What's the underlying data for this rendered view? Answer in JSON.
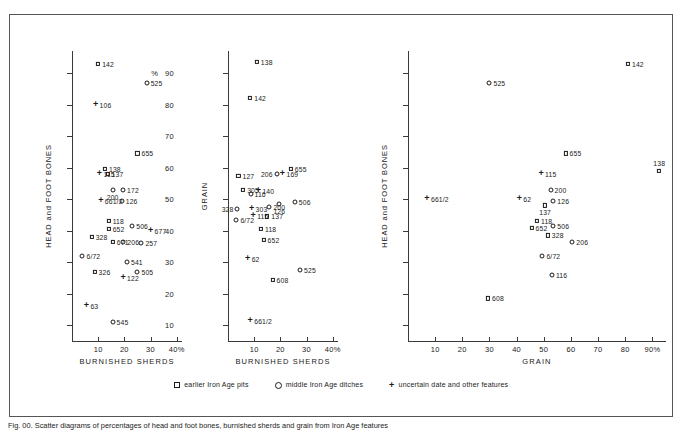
{
  "figure": {
    "caption": "Fig. 00. Scatter diagrams of percentages of head and foot bones, burnished sherds and grain from Iron Age features"
  },
  "legend": {
    "items": [
      {
        "marker": "square-marker",
        "label": "earlier Iron Age  pits"
      },
      {
        "marker": "circle-marker",
        "label": "middle Iron Age ditches"
      },
      {
        "marker": "plus-marker",
        "label": "uncertain date and other features"
      }
    ]
  },
  "chart_data": [
    {
      "type": "scatter",
      "title": "",
      "xlabel": "BURNISHED SHERDS",
      "ylabel": "HEAD and FOOT BONES",
      "x_unit": "%",
      "y_unit": "%",
      "xlim": [
        0,
        42
      ],
      "ylim": [
        5,
        97
      ],
      "xticks": [
        10,
        20,
        30,
        40
      ],
      "xticklabels": [
        "10",
        "20",
        "30",
        "40%"
      ],
      "yticks": [
        10,
        20,
        30,
        40,
        50,
        60,
        70,
        80,
        90
      ],
      "yticklabels": [
        "10",
        "20",
        "30",
        "40",
        "50",
        "60",
        "70",
        "80",
        "90"
      ],
      "grid": false,
      "points": [
        {
          "label": "142",
          "marker": "square",
          "x": 10.0,
          "y": 93.0,
          "lpos": "r"
        },
        {
          "label": "525",
          "marker": "circle",
          "x": 28.5,
          "y": 87.0,
          "lpos": "r"
        },
        {
          "label": "106",
          "marker": "plus",
          "x": 9.0,
          "y": 80.0,
          "lpos": "r"
        },
        {
          "label": "655",
          "marker": "square",
          "x": 25.0,
          "y": 64.5,
          "lpos": "r"
        },
        {
          "label": "138",
          "marker": "square",
          "x": 12.6,
          "y": 59.5,
          "lpos": "r"
        },
        {
          "label": "115",
          "marker": "plus",
          "x": 10.5,
          "y": 58.0,
          "lpos": "r"
        },
        {
          "label": "137",
          "marker": "square",
          "x": 13.6,
          "y": 58.0,
          "lpos": "r"
        },
        {
          "label": "172",
          "marker": "circle",
          "x": 19.5,
          "y": 53.0,
          "lpos": "r"
        },
        {
          "label": "200",
          "marker": "circle",
          "x": 15.5,
          "y": 53.0,
          "lpos": "b"
        },
        {
          "label": "661/2",
          "marker": "plus",
          "x": 11.0,
          "y": 49.5,
          "lpos": "r"
        },
        {
          "label": "126",
          "marker": "circle",
          "x": 19.0,
          "y": 49.5,
          "lpos": "r"
        },
        {
          "label": "118",
          "marker": "square",
          "x": 14.0,
          "y": 43.0,
          "lpos": "r"
        },
        {
          "label": "506",
          "marker": "circle",
          "x": 23.0,
          "y": 41.5,
          "lpos": "r"
        },
        {
          "label": "652",
          "marker": "square",
          "x": 14.0,
          "y": 40.5,
          "lpos": "r"
        },
        {
          "label": "677",
          "marker": "plus",
          "x": 30.0,
          "y": 40.0,
          "lpos": "r"
        },
        {
          "label": "328",
          "marker": "square",
          "x": 7.5,
          "y": 38.0,
          "lpos": "r"
        },
        {
          "label": "671",
          "marker": "square",
          "x": 15.6,
          "y": 36.5,
          "lpos": "r"
        },
        {
          "label": "206",
          "marker": "circle",
          "x": 19.6,
          "y": 36.5,
          "lpos": "r"
        },
        {
          "label": "257",
          "marker": "circle",
          "x": 26.5,
          "y": 36.0,
          "lpos": "r"
        },
        {
          "label": "6/72",
          "marker": "circle",
          "x": 4.0,
          "y": 32.0,
          "lpos": "r"
        },
        {
          "label": "541",
          "marker": "circle",
          "x": 21.0,
          "y": 30.0,
          "lpos": "r"
        },
        {
          "label": "326",
          "marker": "square",
          "x": 8.6,
          "y": 27.0,
          "lpos": "r"
        },
        {
          "label": "505",
          "marker": "circle",
          "x": 25.0,
          "y": 27.0,
          "lpos": "r"
        },
        {
          "label": "122",
          "marker": "plus",
          "x": 19.5,
          "y": 25.0,
          "lpos": "r"
        },
        {
          "label": "63",
          "marker": "plus",
          "x": 5.5,
          "y": 16.0,
          "lpos": "r"
        },
        {
          "label": "545",
          "marker": "circle",
          "x": 15.5,
          "y": 11.0,
          "lpos": "r"
        }
      ]
    },
    {
      "type": "scatter",
      "title": "",
      "xlabel": "BURNISHED SHERDS",
      "ylabel": "GRAIN",
      "x_unit": "%",
      "y_unit": "",
      "xlim": [
        0,
        42
      ],
      "ylim": [
        5,
        97
      ],
      "xticks": [
        10,
        20,
        30,
        40
      ],
      "xticklabels": [
        "10",
        "20",
        "30",
        "40%"
      ],
      "yticks": [
        10,
        20,
        30,
        40,
        50,
        60,
        70,
        80,
        90
      ],
      "yticklabels": [
        "",
        "",
        "",
        "",
        "",
        "",
        "",
        "",
        ""
      ],
      "grid": false,
      "points": [
        {
          "label": "138",
          "marker": "square",
          "x": 11.0,
          "y": 93.5,
          "lpos": "r"
        },
        {
          "label": "142",
          "marker": "square",
          "x": 8.5,
          "y": 82.0,
          "lpos": "r"
        },
        {
          "label": "655",
          "marker": "square",
          "x": 24.0,
          "y": 59.5,
          "lpos": "r"
        },
        {
          "label": "206",
          "marker": "circle",
          "x": 18.6,
          "y": 58.0,
          "lpos": "l"
        },
        {
          "label": "169",
          "marker": "plus",
          "x": 20.8,
          "y": 58.0,
          "lpos": "r"
        },
        {
          "label": "127",
          "marker": "square",
          "x": 4.0,
          "y": 57.5,
          "lpos": "r"
        },
        {
          "label": "305",
          "marker": "square",
          "x": 5.8,
          "y": 53.0,
          "lpos": "r"
        },
        {
          "label": "116",
          "marker": "circle",
          "x": 8.6,
          "y": 51.5,
          "lpos": "r"
        },
        {
          "label": "140",
          "marker": "plus",
          "x": 11.6,
          "y": 52.5,
          "lpos": "r"
        },
        {
          "label": "506",
          "marker": "circle",
          "x": 25.5,
          "y": 49.0,
          "lpos": "r"
        },
        {
          "label": "126",
          "marker": "circle",
          "x": 19.6,
          "y": 48.5,
          "lpos": "b"
        },
        {
          "label": "200",
          "marker": "circle",
          "x": 15.8,
          "y": 47.5,
          "lpos": "r"
        },
        {
          "label": "303",
          "marker": "plus",
          "x": 9.0,
          "y": 47.0,
          "lpos": "r"
        },
        {
          "label": "328",
          "marker": "circle",
          "x": 3.6,
          "y": 47.0,
          "lpos": "l"
        },
        {
          "label": "137",
          "marker": "square",
          "x": 15.0,
          "y": 44.5,
          "lpos": "r"
        },
        {
          "label": "115",
          "marker": "plus",
          "x": 9.6,
          "y": 44.5,
          "lpos": "r"
        },
        {
          "label": "6/72",
          "marker": "circle",
          "x": 3.2,
          "y": 43.5,
          "lpos": "r"
        },
        {
          "label": "118",
          "marker": "square",
          "x": 12.6,
          "y": 40.5,
          "lpos": "r"
        },
        {
          "label": "652",
          "marker": "square",
          "x": 13.6,
          "y": 37.0,
          "lpos": "r"
        },
        {
          "label": "62",
          "marker": "plus",
          "x": 7.5,
          "y": 31.0,
          "lpos": "r"
        },
        {
          "label": "525",
          "marker": "circle",
          "x": 27.5,
          "y": 27.5,
          "lpos": "r"
        },
        {
          "label": "608",
          "marker": "square",
          "x": 17.0,
          "y": 24.5,
          "lpos": "r"
        },
        {
          "label": "661/2",
          "marker": "plus",
          "x": 8.5,
          "y": 11.5,
          "lpos": "r"
        }
      ]
    },
    {
      "type": "scatter",
      "title": "",
      "xlabel": "GRAIN",
      "ylabel": "HEAD and FOOT BONES",
      "x_unit": "%",
      "y_unit": "%",
      "xlim": [
        0,
        95
      ],
      "ylim": [
        5,
        97
      ],
      "xticks": [
        10,
        20,
        30,
        40,
        50,
        60,
        70,
        80,
        90
      ],
      "xticklabels": [
        "10",
        "20",
        "30",
        "40",
        "50",
        "60",
        "70",
        "80",
        "90%"
      ],
      "yticks": [
        10,
        20,
        30,
        40,
        50,
        60,
        70,
        80,
        90
      ],
      "yticklabels": [
        "",
        "",
        "",
        "",
        "",
        "",
        "",
        "",
        ""
      ],
      "grid": false,
      "points": [
        {
          "label": "142",
          "marker": "square",
          "x": 81.0,
          "y": 93.0,
          "lpos": "r"
        },
        {
          "label": "525",
          "marker": "circle",
          "x": 30.0,
          "y": 87.0,
          "lpos": "r"
        },
        {
          "label": "655",
          "marker": "square",
          "x": 58.0,
          "y": 64.5,
          "lpos": "r"
        },
        {
          "label": "138",
          "marker": "square",
          "x": 92.5,
          "y": 59.0,
          "lpos": "t"
        },
        {
          "label": "115",
          "marker": "plus",
          "x": 49.0,
          "y": 58.0,
          "lpos": "r"
        },
        {
          "label": "200",
          "marker": "circle",
          "x": 52.5,
          "y": 53.0,
          "lpos": "r"
        },
        {
          "label": "126",
          "marker": "circle",
          "x": 53.5,
          "y": 49.5,
          "lpos": "r"
        },
        {
          "label": "62",
          "marker": "plus",
          "x": 41.0,
          "y": 50.0,
          "lpos": "r"
        },
        {
          "label": "137",
          "marker": "square",
          "x": 50.5,
          "y": 48.0,
          "lpos": "b"
        },
        {
          "label": "661/2",
          "marker": "plus",
          "x": 7.0,
          "y": 50.0,
          "lpos": "r"
        },
        {
          "label": "118",
          "marker": "square",
          "x": 47.5,
          "y": 43.0,
          "lpos": "r"
        },
        {
          "label": "506",
          "marker": "circle",
          "x": 53.5,
          "y": 41.5,
          "lpos": "r"
        },
        {
          "label": "652",
          "marker": "square",
          "x": 45.5,
          "y": 41.0,
          "lpos": "r"
        },
        {
          "label": "328",
          "marker": "square",
          "x": 51.5,
          "y": 38.5,
          "lpos": "r"
        },
        {
          "label": "206",
          "marker": "circle",
          "x": 60.5,
          "y": 36.5,
          "lpos": "r"
        },
        {
          "label": "6/72",
          "marker": "circle",
          "x": 49.5,
          "y": 32.0,
          "lpos": "r"
        },
        {
          "label": "116",
          "marker": "circle",
          "x": 53.0,
          "y": 26.0,
          "lpos": "r"
        },
        {
          "label": "608",
          "marker": "square",
          "x": 29.5,
          "y": 18.5,
          "lpos": "r"
        }
      ]
    }
  ],
  "panels": [
    {
      "name": "panel-1",
      "left": 60,
      "width": 120
    },
    {
      "name": "panel-2",
      "left": 215,
      "width": 120
    },
    {
      "name": "panel-3",
      "left": 400,
      "width": 265
    }
  ]
}
